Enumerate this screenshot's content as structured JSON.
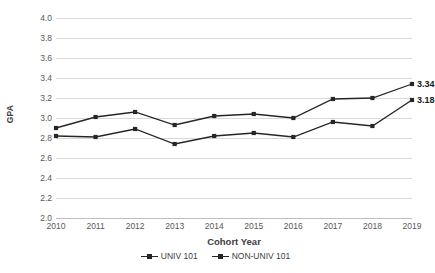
{
  "chart_data": {
    "type": "line",
    "title": "",
    "xlabel": "Cohort Year",
    "ylabel": "GPA",
    "categories": [
      "2010",
      "2011",
      "2012",
      "2013",
      "2014",
      "2015",
      "2016",
      "2017",
      "2018",
      "2019"
    ],
    "ylim": [
      2.0,
      4.0
    ],
    "ytick_step": 0.2,
    "yticks": [
      "4.0",
      "3.8",
      "3.6",
      "3.4",
      "3.2",
      "3.0",
      "2.8",
      "2.6",
      "2.4",
      "2.2",
      "2.0"
    ],
    "grid": true,
    "legend_position": "bottom",
    "series": [
      {
        "name": "UNIV 101",
        "values": [
          2.9,
          3.01,
          3.06,
          2.93,
          3.02,
          3.04,
          3.0,
          3.19,
          3.2,
          3.34
        ],
        "color": "#262626",
        "end_label": "3.34"
      },
      {
        "name": "NON-UNIV 101",
        "values": [
          2.82,
          2.81,
          2.89,
          2.74,
          2.82,
          2.85,
          2.81,
          2.96,
          2.92,
          3.18
        ],
        "color": "#262626",
        "end_label": "3.18"
      }
    ]
  },
  "legend": {
    "items": [
      {
        "label": "UNIV 101"
      },
      {
        "label": "NON-UNIV 101"
      }
    ]
  }
}
